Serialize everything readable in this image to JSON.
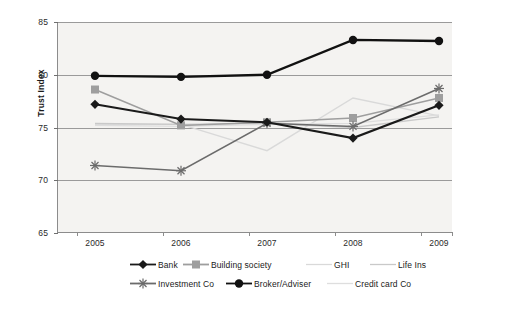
{
  "chart_data": {
    "type": "line",
    "title": "",
    "xlabel": "",
    "ylabel": "Trust Index",
    "categories": [
      "2005",
      "2006",
      "2007",
      "2008",
      "2009"
    ],
    "x": [
      2005,
      2006,
      2007,
      2008,
      2009
    ],
    "ylim": [
      65,
      85
    ],
    "yticks": [
      65,
      70,
      75,
      80,
      85
    ],
    "grid": true,
    "legend_position": "bottom",
    "series": [
      {
        "name": "Bank",
        "values": [
          77.2,
          75.8,
          75.5,
          74.0,
          77.1
        ],
        "color": "#1a1a1a",
        "marker": "diamond",
        "line_width": 2.1
      },
      {
        "name": "Building society",
        "values": [
          78.6,
          75.2,
          75.5,
          75.9,
          77.8
        ],
        "color": "#9e9e9e",
        "marker": "square",
        "line_width": 1.5
      },
      {
        "name": "GHI",
        "values": [
          75.3,
          75.3,
          72.8,
          77.8,
          76.1
        ],
        "color": "#d9d9d9",
        "marker": "none",
        "line_width": 1.4
      },
      {
        "name": "Life Ins",
        "values": [
          75.4,
          75.3,
          75.4,
          75.0,
          76.0
        ],
        "color": "#c9c9c9",
        "marker": "none",
        "line_width": 1.3
      },
      {
        "name": "Investment Co",
        "values": [
          71.4,
          70.9,
          75.4,
          75.1,
          78.7
        ],
        "color": "#6b6b6b",
        "marker": "asterisk",
        "line_width": 1.5
      },
      {
        "name": "Broker/Adviser",
        "values": [
          79.9,
          79.8,
          80.0,
          83.3,
          83.2
        ],
        "color": "#111111",
        "marker": "circle",
        "line_width": 2.3
      },
      {
        "name": "Credit card Co",
        "values": [
          75.2,
          75.1,
          75.3,
          75.4,
          76.2
        ],
        "color": "#dedede",
        "marker": "none",
        "line_width": 1.3
      }
    ]
  },
  "axis": {
    "y_title": "Trust Index",
    "y_ticks": [
      "85",
      "80",
      "75",
      "70",
      "65"
    ],
    "x_ticks": [
      "2005",
      "2006",
      "2007",
      "2008",
      "2009"
    ]
  },
  "legend": {
    "row1": [
      {
        "label": "Bank",
        "marker": "diamond",
        "color": "#1a1a1a"
      },
      {
        "label": "Building society",
        "marker": "square",
        "color": "#9e9e9e"
      },
      {
        "label": "GHI",
        "marker": "none",
        "color": "#d9d9d9"
      },
      {
        "label": "Life Ins",
        "marker": "none",
        "color": "#c9c9c9"
      }
    ],
    "row2": [
      {
        "label": "Investment Co",
        "marker": "asterisk",
        "color": "#6b6b6b"
      },
      {
        "label": "Broker/Adviser",
        "marker": "circle",
        "color": "#111111"
      },
      {
        "label": "Credit card Co",
        "marker": "none",
        "color": "#dedede"
      }
    ]
  },
  "colors": {
    "plot_background": "#f4f3f1",
    "page_background": "#ffffff",
    "gridline": "#9a9a9a",
    "axis": "#8c8c8c",
    "text": "#1a1a1a"
  }
}
